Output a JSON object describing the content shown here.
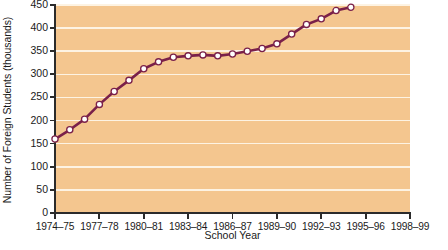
{
  "chart_data": {
    "type": "line",
    "title": "",
    "xlabel": "School Year",
    "ylabel": "Number of Foreign Students (thousands)",
    "ylim": [
      0,
      450
    ],
    "ytick_values": [
      0,
      50,
      100,
      150,
      200,
      250,
      300,
      350,
      400,
      450
    ],
    "ytick_labels": [
      "0",
      "50",
      "100",
      "150",
      "200",
      "250",
      "300",
      "350",
      "400",
      "450"
    ],
    "xtick_labels": [
      "1974–75",
      "1977–78",
      "1980–81",
      "1983–84",
      "1986–87",
      "1989–90",
      "1992–93",
      "1995–96",
      "1998–99"
    ],
    "xlim_years": [
      1974,
      1998
    ],
    "grid": "horizontal",
    "legend": "none",
    "categories": [
      "1974–75",
      "1975–76",
      "1976–77",
      "1977–78",
      "1978–79",
      "1979–80",
      "1980–81",
      "1981–82",
      "1982–83",
      "1983–84",
      "1984–85",
      "1985–86",
      "1986–87",
      "1987–88",
      "1988–89",
      "1989–90",
      "1990–91",
      "1991–92",
      "1992–93",
      "1993–94",
      "1994–95"
    ],
    "x": [
      1974,
      1975,
      1976,
      1977,
      1978,
      1979,
      1980,
      1981,
      1982,
      1983,
      1984,
      1985,
      1986,
      1987,
      1988,
      1989,
      1990,
      1991,
      1992,
      1993,
      1994
    ],
    "values": [
      160,
      180,
      203,
      235,
      263,
      287,
      312,
      327,
      337,
      340,
      342,
      340,
      344,
      350,
      356,
      366,
      387,
      408,
      420,
      438,
      445
    ],
    "colors": {
      "plot_background": "#f4c68f",
      "gridline": "#fdf3e3",
      "line": "#7a2049",
      "marker_fill": "#ffffff",
      "marker_edge": "#7a2049",
      "axis": "#2b2b2b",
      "text": "#1a1a1a"
    }
  }
}
